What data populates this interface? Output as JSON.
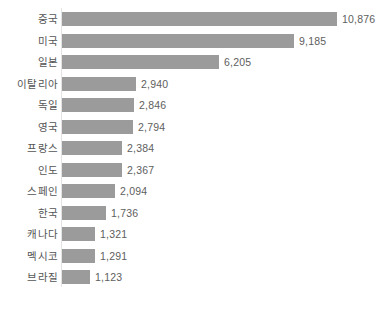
{
  "chart_data": {
    "type": "bar",
    "orientation": "horizontal",
    "title": "",
    "subtitle": "",
    "xlabel": "",
    "ylabel": "",
    "grid": false,
    "legend": null,
    "legend_position": "none",
    "xlim": [
      0,
      10876
    ],
    "categories": [
      "중국",
      "미국",
      "일본",
      "이탈리아",
      "독일",
      "영국",
      "프랑스",
      "인도",
      "스페인",
      "한국",
      "캐나다",
      "멕시코",
      "브라질"
    ],
    "values": [
      10876,
      9185,
      6205,
      2940,
      2846,
      2794,
      2384,
      2367,
      2094,
      1736,
      1321,
      1291,
      1123
    ],
    "value_labels": [
      "10,876",
      "9,185",
      "6,205",
      "2,940",
      "2,846",
      "2,794",
      "2,384",
      "2,367",
      "2,094",
      "1,736",
      "1,321",
      "1,291",
      "1,123"
    ],
    "series": [
      {
        "name": "",
        "values": [
          10876,
          9185,
          6205,
          2940,
          2846,
          2794,
          2384,
          2367,
          2094,
          1736,
          1321,
          1291,
          1123
        ]
      }
    ],
    "bars": [
      {
        "category": "중국",
        "value": 10876,
        "label": "10,876"
      },
      {
        "category": "미국",
        "value": 9185,
        "label": "9,185"
      },
      {
        "category": "일본",
        "value": 6205,
        "label": "6,205"
      },
      {
        "category": "이탈리아",
        "value": 2940,
        "label": "2,940"
      },
      {
        "category": "독일",
        "value": 2846,
        "label": "2,846"
      },
      {
        "category": "영국",
        "value": 2794,
        "label": "2,794"
      },
      {
        "category": "프랑스",
        "value": 2384,
        "label": "2,384"
      },
      {
        "category": "인도",
        "value": 2367,
        "label": "2,367"
      },
      {
        "category": "스페인",
        "value": 2094,
        "label": "2,094"
      },
      {
        "category": "한국",
        "value": 1736,
        "label": "1,736"
      },
      {
        "category": "캐나다",
        "value": 1321,
        "label": "1,321"
      },
      {
        "category": "멕시코",
        "value": 1291,
        "label": "1,291"
      },
      {
        "category": "브라질",
        "value": 1123,
        "label": "1,123"
      }
    ]
  },
  "style": {
    "bar_color": "#9b9b9b",
    "background_color": "#ffffff",
    "label_color": "#555555",
    "value_color": "#5e5e5e",
    "axis_color": "#e3e3e3"
  },
  "layout": {
    "plot_left_px": 62,
    "plot_top_px": 8,
    "row_pitch_px": 21.5,
    "bar_height_px": 14,
    "px_per_unit": 0.02524,
    "value_gap_px": 5
  }
}
